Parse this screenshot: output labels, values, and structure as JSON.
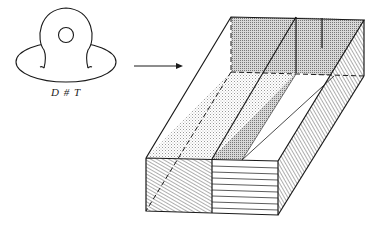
{
  "figure": {
    "left_label": "D # T",
    "left_object": "torus-with-handle",
    "arrow": "maps-to",
    "right_object": "hatched-box-decomposition"
  },
  "colors": {
    "ink": "#1a1a1a",
    "background": "#ffffff",
    "stipple": "#8a8a8a"
  }
}
